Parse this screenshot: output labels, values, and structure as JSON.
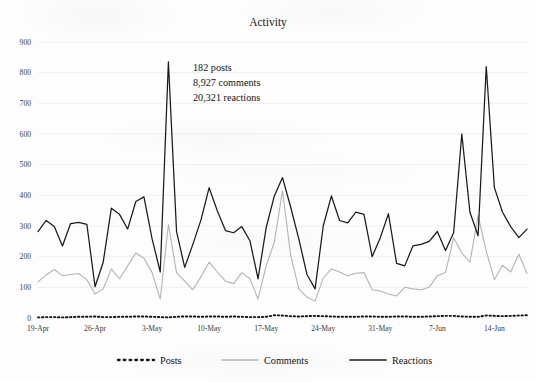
{
  "chart_data": {
    "type": "line",
    "title": "Activity",
    "xlabel": "",
    "ylabel": "",
    "ylim": [
      0,
      900
    ],
    "ytick_step": 100,
    "yticks": [
      0,
      100,
      200,
      300,
      400,
      500,
      600,
      700,
      800,
      900
    ],
    "grid": true,
    "legend_position": "bottom",
    "x_tick_labels": [
      "19-Apr",
      "26-Apr",
      "3-May",
      "10-May",
      "17-May",
      "24-May",
      "31-May",
      "7-Jun",
      "14-Jun"
    ],
    "x_tick_indices": [
      0,
      7,
      14,
      21,
      28,
      35,
      42,
      49,
      56
    ],
    "x_start": "19-Apr",
    "x_end": "18-Jun",
    "n_points": 61,
    "series": [
      {
        "name": "Posts",
        "color": "#111111",
        "style": "dotted",
        "values": [
          2,
          3,
          3,
          2,
          3,
          4,
          4,
          5,
          3,
          3,
          4,
          4,
          5,
          5,
          4,
          3,
          2,
          4,
          5,
          5,
          4,
          5,
          5,
          4,
          5,
          4,
          3,
          3,
          4,
          9,
          8,
          6,
          5,
          6,
          7,
          6,
          5,
          4,
          4,
          4,
          5,
          5,
          4,
          4,
          5,
          5,
          4,
          4,
          5,
          6,
          7,
          7,
          5,
          4,
          4,
          8,
          7,
          6,
          7,
          8,
          9
        ]
      },
      {
        "name": "Comments",
        "color": "#b4b4b4",
        "style": "solid",
        "values": [
          118,
          140,
          158,
          138,
          142,
          145,
          125,
          78,
          95,
          160,
          128,
          170,
          212,
          195,
          148,
          62,
          305,
          148,
          120,
          92,
          135,
          182,
          150,
          120,
          112,
          148,
          128,
          62,
          170,
          248,
          415,
          205,
          95,
          68,
          55,
          130,
          160,
          150,
          138,
          146,
          148,
          92,
          88,
          78,
          72,
          100,
          95,
          92,
          100,
          138,
          148,
          262,
          212,
          182,
          335,
          218,
          125,
          172,
          150,
          208,
          145,
          130,
          110,
          108,
          265,
          165,
          190,
          182,
          208,
          195,
          215
        ]
      },
      {
        "name": "Reactions",
        "color": "#1a1a1a",
        "style": "solid",
        "values": [
          282,
          318,
          298,
          235,
          308,
          312,
          305,
          102,
          182,
          358,
          338,
          290,
          380,
          395,
          258,
          150,
          835,
          282,
          165,
          240,
          320,
          425,
          350,
          285,
          278,
          298,
          252,
          128,
          295,
          398,
          458,
          362,
          258,
          142,
          95,
          300,
          398,
          318,
          310,
          345,
          338,
          200,
          262,
          340,
          178,
          170,
          235,
          240,
          250,
          282,
          220,
          278,
          600,
          345,
          268,
          820,
          425,
          345,
          298,
          262,
          290,
          335,
          340,
          245,
          208,
          825,
          368,
          698,
          612,
          700,
          810
        ]
      }
    ]
  },
  "annotations": {
    "posts_line": "182 posts",
    "comments_line": "8,927 comments",
    "reactions_line": "20,321 reactions"
  },
  "legend": {
    "items": [
      {
        "label": "Posts",
        "icon": "dotted-line-swatch"
      },
      {
        "label": "Comments",
        "icon": "solid-line-swatch"
      },
      {
        "label": "Reactions",
        "icon": "solid-line-swatch"
      }
    ]
  }
}
